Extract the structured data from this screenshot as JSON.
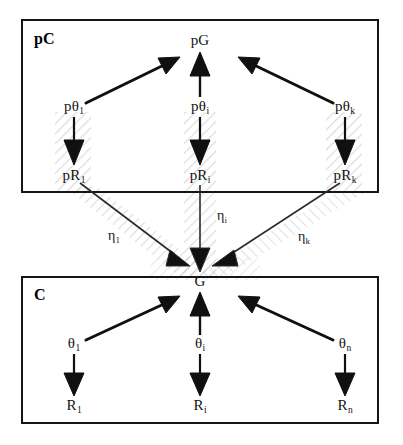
{
  "figure": {
    "type": "hierarchical-graph-diagram",
    "width": 403,
    "height": 445,
    "background_color": "#ffffff",
    "ink_color": "#101010",
    "hatch_color": "#c9c9c9"
  },
  "boxes": [
    {
      "id": "pc-box",
      "label": "pC",
      "label_x": 34,
      "label_y": 31,
      "x": 22,
      "y": 20,
      "width": 356,
      "height": 172
    },
    {
      "id": "c-box",
      "label": "C",
      "label_x": 34,
      "label_y": 287,
      "x": 22,
      "y": 277,
      "width": 356,
      "height": 146
    }
  ],
  "nodes": [
    {
      "id": "pG",
      "base": "pG",
      "sub": "",
      "x": 200,
      "y": 40,
      "box": "pc-box"
    },
    {
      "id": "ptheta1",
      "base": "pθ",
      "sub": "1",
      "x": 74,
      "y": 106,
      "box": "pc-box"
    },
    {
      "id": "pthetai",
      "base": "pθ",
      "sub": "i",
      "x": 200,
      "y": 106,
      "box": "pc-box"
    },
    {
      "id": "pthetak",
      "base": "pθ",
      "sub": "k",
      "x": 345,
      "y": 106,
      "box": "pc-box"
    },
    {
      "id": "pR1",
      "base": "pR",
      "sub": "1",
      "x": 74,
      "y": 175,
      "box": "pc-box"
    },
    {
      "id": "pRi",
      "base": "pR",
      "sub": "i",
      "x": 200,
      "y": 175,
      "box": "pc-box"
    },
    {
      "id": "pRk",
      "base": "pR",
      "sub": "k",
      "x": 345,
      "y": 175,
      "box": "pc-box"
    },
    {
      "id": "G",
      "base": "G",
      "sub": "",
      "x": 200,
      "y": 281,
      "box": "c-box"
    },
    {
      "id": "theta1",
      "base": "θ",
      "sub": "1",
      "x": 74,
      "y": 343,
      "box": "c-box"
    },
    {
      "id": "thetai",
      "base": "θ",
      "sub": "i",
      "x": 200,
      "y": 343,
      "box": "c-box"
    },
    {
      "id": "thetan",
      "base": "θ",
      "sub": "n",
      "x": 345,
      "y": 343,
      "box": "c-box"
    },
    {
      "id": "R1",
      "base": "R",
      "sub": "1",
      "x": 74,
      "y": 405,
      "box": "c-box"
    },
    {
      "id": "Ri",
      "base": "R",
      "sub": "i",
      "x": 200,
      "y": 405,
      "box": "c-box"
    },
    {
      "id": "Rn",
      "base": "R",
      "sub": "n",
      "x": 345,
      "y": 405,
      "box": "c-box"
    }
  ],
  "edges": [
    {
      "id": "ptheta1-to-pG",
      "from": "ptheta1",
      "to": "pG",
      "label": "",
      "sub": "",
      "style": "thick"
    },
    {
      "id": "pthetai-to-pG",
      "from": "pthetai",
      "to": "pG",
      "label": "",
      "sub": "",
      "style": "thick"
    },
    {
      "id": "pthetak-to-pG",
      "from": "pthetak",
      "to": "pG",
      "label": "",
      "sub": "",
      "style": "thick"
    },
    {
      "id": "ptheta1-to-pR1",
      "from": "ptheta1",
      "to": "pR1",
      "label": "",
      "sub": "",
      "style": "thick"
    },
    {
      "id": "pthetai-to-pRi",
      "from": "pthetai",
      "to": "pRi",
      "label": "",
      "sub": "",
      "style": "thick"
    },
    {
      "id": "pthetak-to-pRk",
      "from": "pthetak",
      "to": "pRk",
      "label": "",
      "sub": "",
      "style": "thick"
    },
    {
      "id": "pR1-to-G",
      "from": "pR1",
      "to": "G",
      "label": "η",
      "sub": "1",
      "label_x": 114,
      "label_y": 236,
      "style": "thin"
    },
    {
      "id": "pRi-to-G",
      "from": "pRi",
      "to": "G",
      "label": "η",
      "sub": "i",
      "label_x": 222,
      "label_y": 216,
      "style": "thin"
    },
    {
      "id": "pRk-to-G",
      "from": "pRk",
      "to": "G",
      "label": "η",
      "sub": "k",
      "label_x": 304,
      "label_y": 237,
      "style": "thin"
    },
    {
      "id": "theta1-to-G",
      "from": "theta1",
      "to": "G",
      "label": "",
      "sub": "",
      "style": "thick"
    },
    {
      "id": "thetai-to-G",
      "from": "thetai",
      "to": "G",
      "label": "",
      "sub": "",
      "style": "thick"
    },
    {
      "id": "thetan-to-G",
      "from": "thetan",
      "to": "G",
      "label": "",
      "sub": "",
      "style": "thick"
    },
    {
      "id": "theta1-to-R1",
      "from": "theta1",
      "to": "R1",
      "label": "",
      "sub": "",
      "style": "thick"
    },
    {
      "id": "thetai-to-Ri",
      "from": "thetai",
      "to": "Ri",
      "label": "",
      "sub": "",
      "style": "thick"
    },
    {
      "id": "thetan-to-Rn",
      "from": "thetan",
      "to": "Rn",
      "label": "",
      "sub": "",
      "style": "thick"
    }
  ]
}
